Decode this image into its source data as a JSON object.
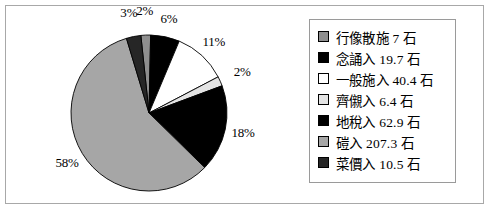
{
  "chart_data": {
    "type": "pie",
    "title": "",
    "unit": "石",
    "legend_position": "right",
    "labels": [
      "行像散施",
      "念誦入",
      "一般施入",
      "齊儭入",
      "地稅入",
      "磑入",
      "菜價入"
    ],
    "values": [
      7,
      19.7,
      40.4,
      6.4,
      62.9,
      207.3,
      10.5
    ],
    "percent_labels": [
      "2%",
      "6%",
      "11%",
      "2%",
      "18%",
      "58%",
      "3%"
    ],
    "slices": [
      {
        "label": "行像散施",
        "value": 7,
        "percent": 2,
        "percent_label": "2%",
        "color": "#8f8f8f"
      },
      {
        "label": "念誦入",
        "value": 19.7,
        "percent": 6,
        "percent_label": "6%",
        "color": "#000000"
      },
      {
        "label": "一般施入",
        "value": 40.4,
        "percent": 11,
        "percent_label": "11%",
        "color": "#ffffff"
      },
      {
        "label": "齊儭入",
        "value": 6.4,
        "percent": 2,
        "percent_label": "2%",
        "color": "#e4e4e4"
      },
      {
        "label": "地稅入",
        "value": 62.9,
        "percent": 18,
        "percent_label": "18%",
        "color": "#000000"
      },
      {
        "label": "磑入",
        "value": 207.3,
        "percent": 58,
        "percent_label": "58%",
        "color": "#a6a6a6"
      },
      {
        "label": "菜價入",
        "value": 10.5,
        "percent": 3,
        "percent_label": "3%",
        "color": "#262626"
      }
    ]
  },
  "legend": {
    "items": [
      {
        "text": "行像散施  7 石",
        "color": "#8f8f8f"
      },
      {
        "text": "念誦入  19.7 石",
        "color": "#000000"
      },
      {
        "text": "一般施入  40.4 石",
        "color": "#ffffff"
      },
      {
        "text": "齊儭入  6.4 石",
        "color": "#e4e4e4"
      },
      {
        "text": "地稅入  62.9 石",
        "color": "#000000"
      },
      {
        "text": "磑入  207.3 石",
        "color": "#a6a6a6"
      },
      {
        "text": "菜價入  10.5 石",
        "color": "#262626"
      }
    ]
  }
}
